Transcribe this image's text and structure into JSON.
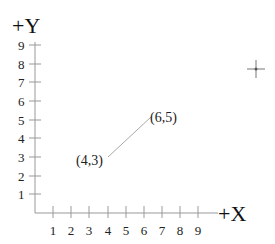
{
  "axes": {
    "y_title": "+Y",
    "x_title": "+X",
    "y_ticks": [
      "1",
      "2",
      "3",
      "4",
      "5",
      "6",
      "7",
      "8",
      "9"
    ],
    "x_ticks": [
      "1",
      "2",
      "3",
      "4",
      "5",
      "6",
      "7",
      "8",
      "9"
    ]
  },
  "segment": {
    "start_label": "(4,3)",
    "end_label": "(6,5)"
  },
  "cursor": {
    "icon": "crosshair-icon"
  }
}
